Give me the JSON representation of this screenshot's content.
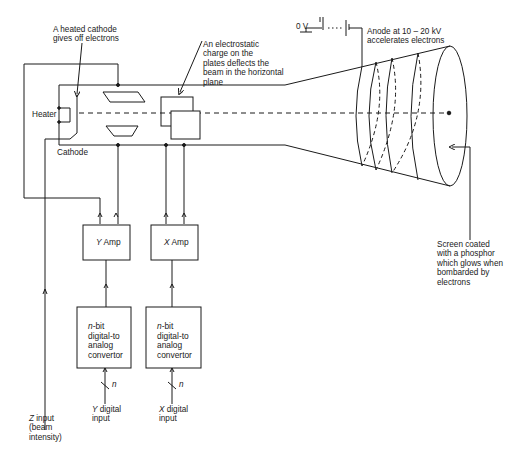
{
  "diagram": {
    "labels": {
      "heated_cathode": "A heated cathode\ngives off electrons",
      "electrostatic": "An electrostatic\ncharge on the\nplates deflects the\nbeam in the horizontal\nplane",
      "zero_volt": "0 V",
      "anode": "Anode at 10 – 20 kV\naccelerates electrons",
      "heater": "Heater",
      "cathode": "Cathode",
      "screen": "Screen coated\nwith a phosphor\nwhich glows when\nbombarded by\nelectrons",
      "z_input_var": "Z",
      "z_input_rest": " input\n(beam\nintensity)",
      "n_y": "n",
      "n_x": "n"
    },
    "blocks": {
      "y_amp": {
        "var": "Y",
        "text": " Amp"
      },
      "x_amp": {
        "var": "X",
        "text": " Amp"
      },
      "y_dac": {
        "var": "n",
        "text": "-bit\ndigital-to\nanalog\nconvertor"
      },
      "x_dac": {
        "var": "n",
        "text": "-bit\ndigital-to\nanalog\nconvertor"
      }
    },
    "inputs": {
      "y_digital": {
        "var": "Y",
        "text": " digital\ninput"
      },
      "x_digital": {
        "var": "X",
        "text": " digital\ninput"
      }
    },
    "colors": {
      "line": "#1a1a1a",
      "background": "#ffffff"
    }
  }
}
